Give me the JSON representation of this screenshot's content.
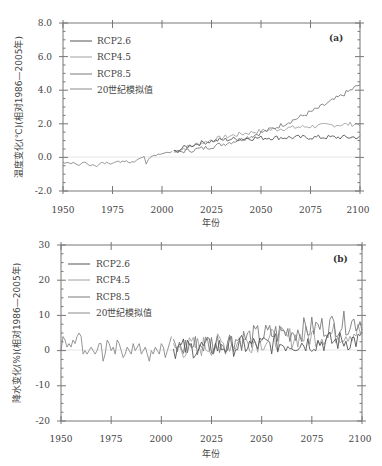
{
  "colors": {
    "rcp26": "#555555",
    "rcp45": "#a0a0a0",
    "rcp85": "#7a7a7a",
    "hist": "#8a8a8a",
    "axis": "#777777",
    "zero_line": "#e6e6e6"
  },
  "chart_data": [
    {
      "type": "line",
      "panel": "(a)",
      "xlabel": "年份",
      "ylabel": "温度变化(℃)(相对1986—2005年)",
      "xlim": [
        1950,
        2100
      ],
      "ylim": [
        -2.0,
        8.0
      ],
      "xticks": [
        1950,
        1975,
        2000,
        2025,
        2050,
        2075,
        2100
      ],
      "yticks": [
        "-2.0",
        "0.0",
        "2.0",
        "4.0",
        "6.0",
        "8.0"
      ],
      "legend": [
        "RCP2.6",
        "RCP4.5",
        "RCP8.5",
        "20世纪模拟值"
      ],
      "legend_position": "upper left",
      "grid": false,
      "series": [
        {
          "name": "20世纪模拟值",
          "x_range": [
            1950,
            2005
          ],
          "values": [
            -0.3,
            -0.35,
            -0.3,
            -0.32,
            -0.38,
            -0.3,
            -0.35,
            -0.42,
            -0.48,
            -0.4,
            -0.3,
            -0.28,
            -0.35,
            -0.45,
            -0.5,
            -0.42,
            -0.48,
            -0.55,
            -0.45,
            -0.32,
            -0.3,
            -0.38,
            -0.28,
            -0.35,
            -0.4,
            -0.35,
            -0.3,
            -0.25,
            -0.22,
            -0.3,
            -0.22,
            -0.25,
            -0.2,
            -0.3,
            -0.32,
            -0.25,
            -0.28,
            -0.18,
            -0.1,
            -0.05,
            0.0,
            0.05,
            -0.4,
            -0.15,
            0.0,
            0.08,
            0.12,
            0.1,
            0.2,
            0.18,
            0.22,
            0.25,
            0.3,
            0.3,
            0.28,
            0.35
          ]
        },
        {
          "name": "RCP2.6",
          "x_range": [
            2006,
            2100
          ],
          "summary": "rises from ~0.3 to ~1.2 by 2040, then flat ~1.1-1.2 through 2100",
          "endpoints": {
            "2006": 0.3,
            "2050": 1.2,
            "2100": 1.15
          }
        },
        {
          "name": "RCP4.5",
          "x_range": [
            2006,
            2100
          ],
          "summary": "rises steadily to ~1.8 by 2060, ~2.1 by 2100",
          "endpoints": {
            "2006": 0.3,
            "2050": 1.6,
            "2100": 2.1
          }
        },
        {
          "name": "RCP8.5",
          "x_range": [
            2006,
            2100
          ],
          "summary": "rises sharply, ~2.0 by 2050, ~4.6 by 2100",
          "endpoints": {
            "2006": 0.3,
            "2050": 2.1,
            "2100": 4.6
          }
        }
      ]
    },
    {
      "type": "line",
      "panel": "(b)",
      "xlabel": "年份",
      "ylabel": "降水变化(%)(相对1986—2005年)",
      "xlim": [
        1950,
        2100
      ],
      "ylim": [
        -20,
        30
      ],
      "xticks": [
        1950,
        1975,
        2000,
        2025,
        2050,
        2075,
        2100
      ],
      "yticks": [
        "-20",
        "-10",
        "0",
        "10",
        "20",
        "30"
      ],
      "legend": [
        "RCP2.6",
        "RCP4.5",
        "RCP8.5",
        "20世纪模拟值"
      ],
      "legend_position": "upper left",
      "grid": false,
      "series": [
        {
          "name": "20世纪模拟值",
          "x_range": [
            1950,
            2005
          ],
          "values": [
            0,
            4,
            3,
            1,
            2,
            1,
            3,
            2,
            4,
            5,
            4,
            -1,
            0,
            -1,
            0,
            1,
            0,
            -1,
            0,
            2,
            2,
            -3,
            -1,
            3,
            2,
            0,
            1,
            -1,
            3,
            2,
            0,
            -2,
            -1,
            1,
            0,
            -1,
            2,
            0,
            1,
            2,
            -1,
            0,
            1,
            -1,
            -3,
            0,
            -1,
            1,
            0,
            -1,
            2,
            1,
            -2,
            0,
            2,
            4
          ]
        },
        {
          "name": "RCP2.6",
          "x_range": [
            2006,
            2100
          ],
          "summary": "fluctuates ~0-5%, mean ~2-3%",
          "endpoints": {
            "2100": 3
          }
        },
        {
          "name": "RCP4.5",
          "x_range": [
            2006,
            2100
          ],
          "summary": "fluctuates, rises to ~5-8% late century",
          "endpoints": {
            "2100": 5
          }
        },
        {
          "name": "RCP8.5",
          "x_range": [
            2006,
            2100
          ],
          "summary": "fluctuates, rises to ~8-14% late century",
          "endpoints": {
            "2100": 11
          }
        }
      ]
    }
  ],
  "panel_a": {
    "label": "(a)",
    "xlabel": "年份",
    "ylabel": "温度变化(℃)(相对1986—2005年)",
    "yticks": [
      "8.0",
      "6.0",
      "4.0",
      "2.0",
      "0.0",
      "-2.0"
    ],
    "xticks": [
      "1950",
      "1975",
      "2000",
      "2025",
      "2050",
      "2075",
      "2100"
    ],
    "legend": [
      "RCP2.6",
      "RCP4.5",
      "RCP8.5",
      "20世纪模拟值"
    ]
  },
  "panel_b": {
    "label": "(b)",
    "xlabel": "年份",
    "ylabel": "降水变化(%)(相对1986—2005年)",
    "yticks": [
      "30",
      "20",
      "10",
      "0",
      "-10",
      "-20"
    ],
    "xticks": [
      "1950",
      "1975",
      "2000",
      "2025",
      "2050",
      "2075",
      "2100"
    ],
    "legend": [
      "RCP2.6",
      "RCP4.5",
      "RCP8.5",
      "20世纪模拟值"
    ]
  }
}
